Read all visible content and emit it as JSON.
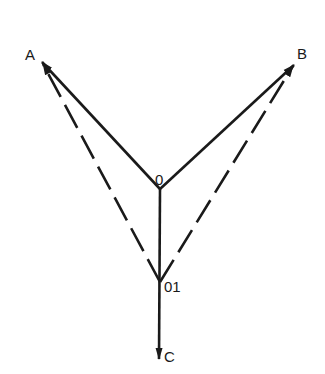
{
  "diagram": {
    "title": "",
    "line_color": "#1a1a1a",
    "nodes": {
      "A": {
        "label": "A",
        "x": 41,
        "y": 61
      },
      "B": {
        "label": "B",
        "x": 295,
        "y": 64
      },
      "O": {
        "label": "0",
        "x": 160,
        "y": 189
      },
      "O1": {
        "label": "01",
        "x": 160,
        "y": 282
      },
      "C": {
        "label": "C",
        "x": 159,
        "y": 360
      }
    },
    "edges": [
      {
        "from": "O",
        "to": "A",
        "style": "solid",
        "arrow": "end"
      },
      {
        "from": "O",
        "to": "B",
        "style": "solid",
        "arrow": "end"
      },
      {
        "from": "O",
        "to": "C",
        "style": "solid",
        "arrow": "end"
      },
      {
        "from": "O1",
        "to": "A",
        "style": "dashed",
        "arrow": "end"
      },
      {
        "from": "O1",
        "to": "B",
        "style": "dashed",
        "arrow": "end"
      }
    ],
    "labels": {
      "A": "A",
      "B": "B",
      "O": "0",
      "O1": "01",
      "C": "C"
    }
  }
}
